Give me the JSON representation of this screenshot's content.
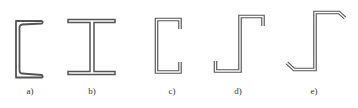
{
  "figure": {
    "stroke_color": "#555555",
    "inner_color": "#ffffff",
    "profiles": [
      {
        "id": "a",
        "label": "a)",
        "shape": "channel-tapered-flange",
        "label_x": 30
      },
      {
        "id": "b",
        "label": "b)",
        "shape": "i-beam",
        "label_x": 92
      },
      {
        "id": "c",
        "label": "c)",
        "shape": "lipped-channel",
        "label_x": 172
      },
      {
        "id": "d",
        "label": "d)",
        "shape": "lipped-z-section",
        "label_x": 238
      },
      {
        "id": "e",
        "label": "e)",
        "shape": "z-section-angled-lips",
        "label_x": 314
      }
    ]
  }
}
